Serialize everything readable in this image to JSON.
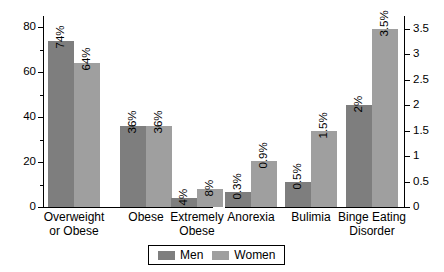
{
  "chart_data": {
    "type": "bar",
    "title": "",
    "xlabel": "",
    "categories": [
      "Overweight or Obese",
      "Obese",
      "Extremely Obese",
      "Anorexia",
      "Bulimia",
      "Binge Eating Disorder"
    ],
    "series": [
      {
        "name": "Men",
        "values": [
          74,
          36,
          4,
          0.3,
          0.5,
          2
        ],
        "color": "#7e7e7e"
      },
      {
        "name": "Women",
        "values": [
          64,
          36,
          8,
          0.9,
          1.5,
          3.5
        ],
        "color": "#9f9f9f"
      }
    ],
    "data_labels": {
      "Overweight or Obese": {
        "Men": "74%",
        "Women": "64%"
      },
      "Obese": {
        "Men": "36%",
        "Women": "36%"
      },
      "Extremely Obese": {
        "Men": "4%",
        "Women": "8%"
      },
      "Anorexia": {
        "Men": "0.3%",
        "Women": "0.9%"
      },
      "Bulimia": {
        "Men": "0.5%",
        "Women": "1.5%"
      },
      "Binge Eating Disorder": {
        "Men": "2%",
        "Women": "3.5%"
      }
    },
    "axes": {
      "left": {
        "ylabel": "",
        "ylim": [
          0,
          85
        ],
        "major_ticks": [
          0,
          20,
          40,
          60,
          80
        ],
        "tick_labels": [
          "0",
          "20",
          "40",
          "60",
          "80"
        ],
        "minor_ticks": [
          10,
          30,
          50,
          70
        ],
        "applies_to": [
          "Overweight or Obese",
          "Obese",
          "Extremely Obese"
        ]
      },
      "right": {
        "ylabel": "",
        "ylim": [
          0,
          3.75
        ],
        "major_ticks": [
          0,
          0.5,
          1,
          1.5,
          2,
          2.5,
          3,
          3.5
        ],
        "tick_labels": [
          "0",
          "0.5",
          "1",
          "1.5",
          "2",
          "2.5",
          "3",
          "3.5"
        ],
        "applies_to": [
          "Anorexia",
          "Bulimia",
          "Binge Eating Disorder"
        ]
      }
    },
    "grid": false,
    "legend": {
      "position": "bottom-center",
      "entries": [
        {
          "label": "Men",
          "color": "#7e7e7e"
        },
        {
          "label": "Women",
          "color": "#9f9f9f"
        }
      ]
    }
  },
  "category_label_lines": {
    "Overweight or Obese": [
      "Overweight",
      "or Obese"
    ],
    "Obese": [
      "Obese"
    ],
    "Extremely Obese": [
      "Extremely",
      "Obese"
    ],
    "Anorexia": [
      "Anorexia"
    ],
    "Bulimia": [
      "Bulimia"
    ],
    "Binge Eating Disorder": [
      "Binge Eating",
      "Disorder"
    ]
  }
}
